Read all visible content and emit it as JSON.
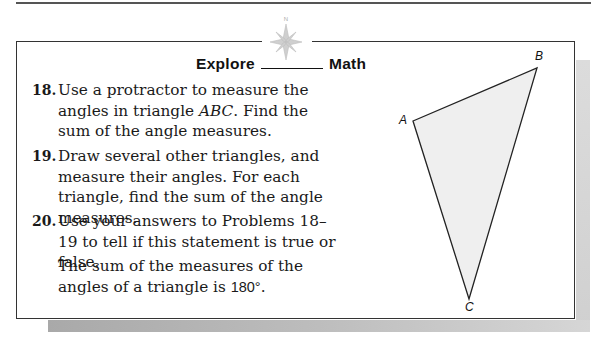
{
  "header": {
    "compass_label": "N",
    "title_left": "Explore",
    "title_right": "Math"
  },
  "problems": [
    {
      "number": "18.",
      "text_before": "Use a protractor to measure the angles in triangle ",
      "text_italic": "ABC",
      "text_after": ". Find the sum of the angle measures."
    },
    {
      "number": "19.",
      "text": "Draw several other triangles, and measure their angles. For each triangle, find the sum of the angle measures."
    },
    {
      "number": "20.",
      "text": "Use your answers to Problems 18–19 to tell if this statement is true or false."
    }
  ],
  "statement": {
    "text": "The sum of the measures of the angles of a triangle is ",
    "value": "180°",
    "end": "."
  },
  "figure": {
    "vertices": [
      {
        "label": "A",
        "x": 413,
        "y": 121
      },
      {
        "label": "B",
        "x": 537,
        "y": 68
      },
      {
        "label": "C",
        "x": 469,
        "y": 299
      }
    ],
    "fill": "#efefef",
    "stroke": "#222222"
  }
}
